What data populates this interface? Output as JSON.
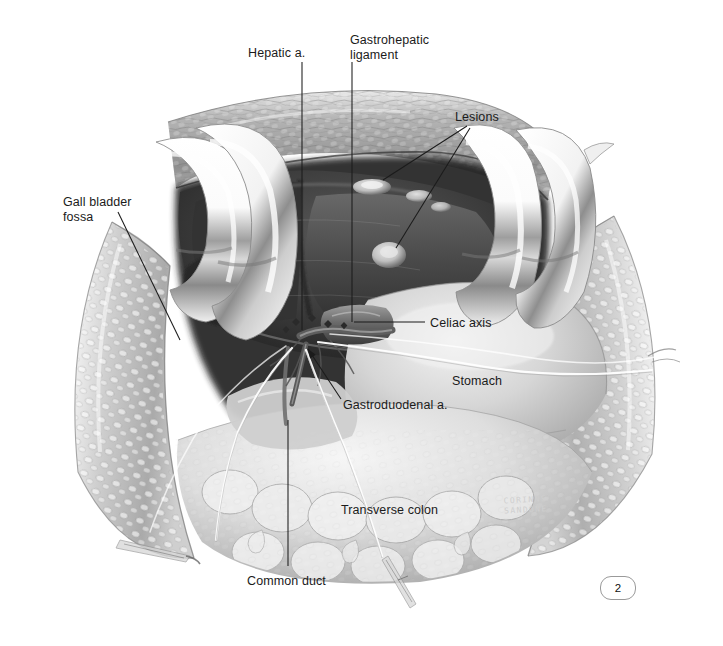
{
  "figure": {
    "domain_note": "grayscale surgical anatomy illustration",
    "page_number": "2",
    "signature_line1": "CORINNE",
    "signature_line2": "SANDONE",
    "background_color": "#ffffff",
    "ink_color": "#1b1b1b"
  },
  "labels": [
    {
      "id": "hepatic-artery",
      "text": "Hepatic a.",
      "x": 248,
      "y": 46,
      "align": "left"
    },
    {
      "id": "gastrohepatic-ligament",
      "text": "Gastrohepatic\nligament",
      "x": 350,
      "y": 33,
      "align": "left"
    },
    {
      "id": "lesions",
      "text": "Lesions",
      "x": 455,
      "y": 110,
      "align": "left"
    },
    {
      "id": "gall-bladder-fossa",
      "text": "Gall bladder\nfossa",
      "x": 63,
      "y": 195,
      "align": "left"
    },
    {
      "id": "celiac-axis",
      "text": "Celiac axis",
      "x": 430,
      "y": 316,
      "align": "left"
    },
    {
      "id": "stomach",
      "text": "Stomach",
      "x": 452,
      "y": 374,
      "align": "left"
    },
    {
      "id": "gastroduodenal-artery",
      "text": "Gastroduodenal a.",
      "x": 343,
      "y": 398,
      "align": "left"
    },
    {
      "id": "transverse-colon",
      "text": "Transverse colon",
      "x": 341,
      "y": 503,
      "align": "left"
    },
    {
      "id": "common-duct",
      "text": "Common duct",
      "x": 247,
      "y": 574,
      "align": "left"
    }
  ],
  "leader_lines": [
    {
      "id": "leader-hepatic-artery",
      "points": "302,62 302,330",
      "arrow": false
    },
    {
      "id": "leader-gastrohepatic-ligament",
      "points": "352,62 352,322",
      "arrow": false
    },
    {
      "id": "leader-lesions-upper",
      "points": "467,126 383,180",
      "arrow": false
    },
    {
      "id": "leader-lesions-lower",
      "points": "470,128 396,248",
      "arrow": false
    },
    {
      "id": "leader-gall-bladder-fossa",
      "points": "118,212 180,340",
      "arrow": false
    },
    {
      "id": "leader-celiac-axis",
      "points": "425,322 354,322",
      "arrow": false
    },
    {
      "id": "leader-gastroduodenal-artery",
      "points": "341,399 308,349",
      "arrow": true
    },
    {
      "id": "leader-common-duct",
      "points": "288,566 288,420",
      "arrow": false
    }
  ],
  "anatomy": {
    "liver": {
      "name": "Liver",
      "tone": "#3a3a3a",
      "lesion_tone": "#d8d8d8",
      "lesion_count": 4
    },
    "stomach": {
      "name": "Stomach",
      "tone": "#d2d2d2"
    },
    "transverse_colon": {
      "name": "Transverse colon",
      "tone": "#dcdcdc"
    },
    "abdominal_wall": {
      "name": "Abdominal wall flap",
      "tone": "#c4c4c4"
    },
    "retractors": {
      "name": "Deaver retractor blades",
      "count": 4,
      "tone": "#f4f4f4"
    },
    "vessels": {
      "name": "Hepatic artery, gastroduodenal artery, common duct",
      "tone": "#6e6e6e"
    },
    "vessel_loops": {
      "name": "Vessel loops / suture",
      "tone": "#fbfbfb",
      "count": 4
    }
  }
}
